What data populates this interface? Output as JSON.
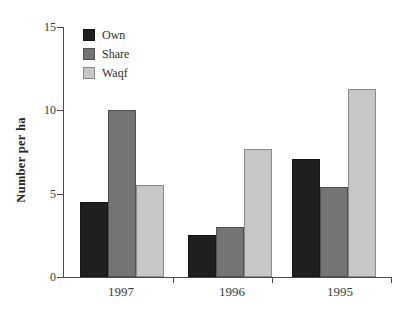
{
  "chart_data": {
    "type": "bar",
    "title": "",
    "xlabel": "",
    "ylabel": "Number per ha",
    "categories": [
      "1997",
      "1996",
      "1995"
    ],
    "series": [
      {
        "name": "Own",
        "color": "#1f1f1f",
        "values": [
          4.5,
          2.5,
          7.1
        ]
      },
      {
        "name": "Share",
        "color": "#747474",
        "values": [
          10.0,
          3.0,
          5.4
        ]
      },
      {
        "name": "Waqf",
        "color": "#c7c7c7",
        "values": [
          5.5,
          7.7,
          11.3
        ]
      }
    ],
    "ylim": [
      0,
      15
    ],
    "yticks": [
      0,
      5,
      10,
      15
    ],
    "grid": false,
    "legend_position": "upper-left-inside",
    "axis_color": "#4a4a4a"
  }
}
